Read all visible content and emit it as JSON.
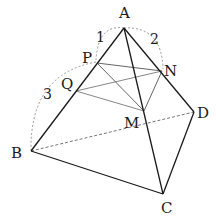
{
  "diagram": {
    "type": "tetrahedron",
    "vertices": {
      "A": {
        "label": "A",
        "x": 124,
        "y": 28
      },
      "B": {
        "label": "B",
        "x": 31,
        "y": 151
      },
      "C": {
        "label": "C",
        "x": 163,
        "y": 194
      },
      "D": {
        "label": "D",
        "x": 194,
        "y": 112
      }
    },
    "points": {
      "P": {
        "label": "P",
        "x": 97,
        "y": 63
      },
      "Q": {
        "label": "Q",
        "x": 76,
        "y": 91
      },
      "N": {
        "label": "N",
        "x": 162,
        "y": 71
      },
      "M": {
        "label": "M",
        "x": 144,
        "y": 111
      }
    },
    "ratio_labels": {
      "AP": "1",
      "AN": "2",
      "PB": "3"
    },
    "colors": {
      "edge": "#1a1a1a",
      "inner": "#6a6a6a",
      "dashed": "#888888"
    }
  }
}
